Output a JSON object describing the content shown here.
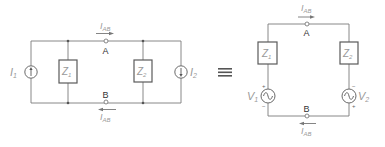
{
  "diagram": {
    "type": "circuit-equivalence",
    "equivalence_symbol": "≡",
    "left_circuit": {
      "name": "current-source-equivalent",
      "sources": [
        {
          "id": "I1",
          "label_main": "I",
          "label_sub": "1",
          "kind": "current",
          "direction": "up"
        },
        {
          "id": "I2",
          "label_main": "I",
          "label_sub": "2",
          "kind": "current",
          "direction": "down"
        }
      ],
      "impedances": [
        {
          "id": "Z1",
          "label_main": "Z",
          "label_sub": "1"
        },
        {
          "id": "Z2",
          "label_main": "Z",
          "label_sub": "2"
        }
      ],
      "nodes": [
        {
          "id": "A",
          "label": "A"
        },
        {
          "id": "B",
          "label": "B"
        }
      ],
      "currents": [
        {
          "label_main": "I",
          "label_sub": "AB",
          "position": "top",
          "direction": "right"
        },
        {
          "label_main": "I",
          "label_sub": "AB",
          "position": "bottom",
          "direction": "left"
        }
      ]
    },
    "right_circuit": {
      "name": "voltage-source-equivalent",
      "sources": [
        {
          "id": "V1",
          "label_main": "V",
          "label_sub": "1",
          "kind": "ac-voltage",
          "polarity_top": "+",
          "polarity_bottom": "−"
        },
        {
          "id": "V2",
          "label_main": "V",
          "label_sub": "2",
          "kind": "ac-voltage",
          "polarity_top": "−",
          "polarity_bottom": "+"
        }
      ],
      "impedances": [
        {
          "id": "Z1",
          "label_main": "Z",
          "label_sub": "1"
        },
        {
          "id": "Z2",
          "label_main": "Z",
          "label_sub": "2"
        }
      ],
      "nodes": [
        {
          "id": "A",
          "label": "A"
        },
        {
          "id": "B",
          "label": "B"
        }
      ],
      "currents": [
        {
          "label_main": "I",
          "label_sub": "AB",
          "position": "top",
          "direction": "right"
        },
        {
          "label_main": "I",
          "label_sub": "AB",
          "position": "bottom",
          "direction": "left"
        }
      ]
    }
  }
}
